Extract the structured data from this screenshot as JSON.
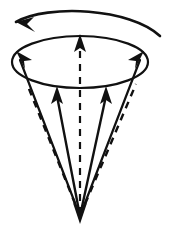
{
  "figure": {
    "type": "diagram",
    "canvas": {
      "width": 169,
      "height": 234,
      "background": "#ffffff",
      "ink": "#111111"
    },
    "elements": {
      "rotation_arrow": {
        "name": "rotation direction arrow",
        "style": "solid",
        "direction": "leftward (counter-clockwise)",
        "path": "M 160 36 C 130 8, 48 4, 16 22",
        "arrowhead": "M 16 22 L 34 17 L 27 24 L 35 32 Z"
      },
      "rim_ellipse": {
        "name": "cone rim",
        "style": "solid",
        "cx": 80,
        "cy": 62,
        "rx": 68,
        "ry": 26,
        "stroke_width": 2.2
      },
      "cone_apex": {
        "name": "cone apex",
        "x": 80,
        "y": 218
      },
      "apex_arrowhead": {
        "name": "downward apex arrowhead",
        "path": "M 80 224 L 73 203 L 80 208 L 87 203 Z"
      },
      "vectors": [
        {
          "id": "center-axis",
          "name": "central axis vector",
          "style": "dashed",
          "from": [
            80,
            216
          ],
          "to": [
            80,
            40
          ],
          "arrowhead": "up",
          "head_path": "M 80 34 L 74 52 L 80 48 L 86 52 Z"
        },
        {
          "id": "left-rim",
          "name": "left rim vector",
          "style": "solid",
          "from": [
            80,
            216
          ],
          "to": [
            18,
            54
          ],
          "arrowhead": "up-left",
          "head_path": "M 16 51 L 25 69 L 24 61 L 32 60 Z"
        },
        {
          "id": "right-rim",
          "name": "right rim vector",
          "style": "solid",
          "from": [
            80,
            216
          ],
          "to": [
            142,
            54
          ],
          "arrowhead": "up-right",
          "head_path": "M 144 51 L 128 60 L 136 61 L 135 69 Z"
        },
        {
          "id": "left-inner",
          "name": "left inner solid vector",
          "style": "solid",
          "from": [
            80,
            216
          ],
          "to": [
            57,
            90
          ],
          "arrowhead": "up",
          "head_path": "M 57 86 L 51 104 L 57 100 L 63 104 Z"
        },
        {
          "id": "right-inner",
          "name": "right inner solid vector",
          "style": "solid",
          "from": [
            80,
            216
          ],
          "to": [
            106,
            90
          ],
          "arrowhead": "up",
          "head_path": "M 106 86 L 100 104 L 106 100 L 112 104 Z"
        },
        {
          "id": "left-outer",
          "name": "left outer dashed cone edge",
          "style": "dashed",
          "from": [
            80,
            216
          ],
          "to": [
            27,
            84
          ]
        },
        {
          "id": "right-outer",
          "name": "right outer dashed cone edge",
          "style": "dashed",
          "from": [
            80,
            216
          ],
          "to": [
            136,
            84
          ]
        }
      ]
    }
  }
}
